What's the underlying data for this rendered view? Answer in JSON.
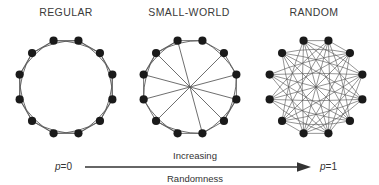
{
  "figure": {
    "background_color": "#ffffff",
    "node_color": "#1a1a1a",
    "edge_color": "#555555",
    "text_color": "#333333",
    "width": 379,
    "height": 185
  },
  "panels": [
    {
      "id": "regular",
      "label": "REGULAR",
      "description": "Ring lattice of 12 nodes, each joined to its 2 nearest neighbours on each side",
      "node_count": 12,
      "p_value": "0"
    },
    {
      "id": "small-world",
      "label": "SMALL-WORLD",
      "description": "Ring lattice with a few edges randomly rewired into long-range shortcuts",
      "node_count": 12,
      "p_value": "intermediate"
    },
    {
      "id": "random",
      "label": "RANDOM",
      "description": "All edges randomly rewired, producing a dense set of crossing chords",
      "node_count": 12,
      "p_value": "1"
    }
  ],
  "axis": {
    "left_label_var": "p",
    "left_label_rest": "=0",
    "right_label_var": "p",
    "right_label_rest": "=1",
    "caption_line1": "Increasing",
    "caption_line2": "Randomness",
    "arrow_color": "#333333"
  },
  "chart_data": {
    "type": "diagram",
    "xlabel": "Increasing Randomness",
    "x_range_labels": [
      "p=0",
      "p=1"
    ],
    "categories": [
      "REGULAR",
      "SMALL-WORLD",
      "RANDOM"
    ],
    "nodes_per_graph": 12,
    "node_angles_deg": [
      15,
      45,
      75,
      105,
      135,
      165,
      195,
      225,
      255,
      285,
      315,
      345
    ],
    "graphs": [
      {
        "name": "REGULAR",
        "center": [
          66,
          87
        ],
        "radius": 48,
        "straight_edges": [
          [
            0,
            1
          ],
          [
            1,
            2
          ],
          [
            2,
            3
          ],
          [
            3,
            4
          ],
          [
            4,
            5
          ],
          [
            5,
            6
          ],
          [
            6,
            7
          ],
          [
            7,
            8
          ],
          [
            8,
            9
          ],
          [
            9,
            10
          ],
          [
            10,
            11
          ],
          [
            11,
            0
          ]
        ],
        "curved_edges": [
          [
            0,
            2
          ],
          [
            1,
            3
          ],
          [
            2,
            4
          ],
          [
            3,
            5
          ],
          [
            4,
            6
          ],
          [
            5,
            7
          ],
          [
            6,
            8
          ],
          [
            7,
            9
          ],
          [
            8,
            10
          ],
          [
            9,
            11
          ],
          [
            10,
            0
          ],
          [
            11,
            1
          ]
        ]
      },
      {
        "name": "SMALL-WORLD",
        "center": [
          190,
          87
        ],
        "radius": 48,
        "straight_edges": [
          [
            0,
            1
          ],
          [
            1,
            2
          ],
          [
            2,
            3
          ],
          [
            3,
            4
          ],
          [
            4,
            5
          ],
          [
            5,
            6
          ],
          [
            6,
            7
          ],
          [
            7,
            8
          ],
          [
            8,
            9
          ],
          [
            9,
            10
          ],
          [
            10,
            11
          ],
          [
            11,
            0
          ]
        ],
        "curved_edges": [
          [
            0,
            2
          ],
          [
            2,
            4
          ],
          [
            3,
            5
          ],
          [
            5,
            7
          ],
          [
            6,
            8
          ],
          [
            8,
            10
          ],
          [
            9,
            11
          ],
          [
            10,
            0
          ]
        ],
        "chord_edges": [
          [
            1,
            7
          ],
          [
            4,
            10
          ],
          [
            3,
            9
          ],
          [
            11,
            5
          ],
          [
            2,
            8
          ]
        ]
      },
      {
        "name": "RANDOM",
        "center": [
          316,
          87
        ],
        "radius": 48,
        "straight_edges": [
          [
            0,
            1
          ],
          [
            5,
            6
          ],
          [
            6,
            7
          ],
          [
            11,
            0
          ]
        ],
        "chord_edges": [
          [
            0,
            5
          ],
          [
            0,
            6
          ],
          [
            0,
            7
          ],
          [
            0,
            8
          ],
          [
            1,
            6
          ],
          [
            1,
            7
          ],
          [
            1,
            9
          ],
          [
            1,
            10
          ],
          [
            2,
            7
          ],
          [
            2,
            8
          ],
          [
            2,
            9
          ],
          [
            2,
            11
          ],
          [
            3,
            8
          ],
          [
            3,
            9
          ],
          [
            3,
            10
          ],
          [
            3,
            11
          ],
          [
            4,
            9
          ],
          [
            4,
            10
          ],
          [
            4,
            11
          ],
          [
            4,
            0
          ],
          [
            5,
            10
          ],
          [
            5,
            11
          ],
          [
            5,
            1
          ],
          [
            5,
            2
          ],
          [
            6,
            11
          ],
          [
            6,
            2
          ],
          [
            6,
            3
          ],
          [
            7,
            3
          ],
          [
            7,
            4
          ],
          [
            8,
            4
          ],
          [
            8,
            5
          ],
          [
            9,
            5
          ],
          [
            10,
            6
          ],
          [
            11,
            7
          ],
          [
            2,
            10
          ],
          [
            1,
            8
          ]
        ]
      }
    ]
  }
}
